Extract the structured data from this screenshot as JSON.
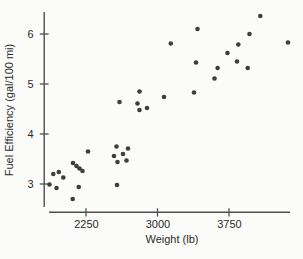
{
  "chart_data": {
    "type": "scatter",
    "title": "",
    "xlabel": "Weight (lb)",
    "ylabel": "Fuel Efficiency (gal/100 mi)",
    "x_ticks": [
      2250,
      3000,
      3750
    ],
    "y_ticks": [
      3,
      4,
      5,
      6
    ],
    "xlim": [
      1850,
      4450
    ],
    "ylim": [
      2.55,
      6.45
    ],
    "grid": false,
    "legend": "none",
    "point_color": "#3e3e3e",
    "axis_color": "#4f4f4f",
    "tick_label_color": "#2b2b2b",
    "points": [
      [
        4078,
        6.36
      ],
      [
        3965,
        6.0
      ],
      [
        4369,
        5.83
      ],
      [
        3848,
        5.79
      ],
      [
        3420,
        6.1
      ],
      [
        3139,
        5.81
      ],
      [
        3734,
        5.62
      ],
      [
        3834,
        5.45
      ],
      [
        3946,
        5.32
      ],
      [
        3630,
        5.32
      ],
      [
        3598,
        5.11
      ],
      [
        3404,
        5.43
      ],
      [
        3383,
        4.83
      ],
      [
        3068,
        4.74
      ],
      [
        2890,
        4.52
      ],
      [
        2811,
        4.85
      ],
      [
        2601,
        4.64
      ],
      [
        2790,
        4.61
      ],
      [
        2811,
        4.48
      ],
      [
        2570,
        3.75
      ],
      [
        2691,
        3.71
      ],
      [
        2638,
        3.6
      ],
      [
        2544,
        3.56
      ],
      [
        2580,
        3.44
      ],
      [
        2675,
        3.47
      ],
      [
        2575,
        2.98
      ],
      [
        2271,
        3.65
      ],
      [
        2114,
        3.42
      ],
      [
        2150,
        3.36
      ],
      [
        2182,
        3.31
      ],
      [
        2213,
        3.26
      ],
      [
        1965,
        3.24
      ],
      [
        1907,
        3.2
      ],
      [
        2012,
        3.13
      ],
      [
        1867,
        2.99
      ],
      [
        1941,
        2.92
      ],
      [
        2173,
        2.94
      ],
      [
        2110,
        2.7
      ]
    ]
  }
}
